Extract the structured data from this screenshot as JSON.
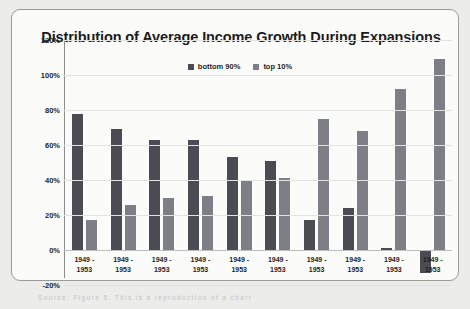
{
  "chart_data": {
    "type": "bar",
    "title": "Distribution of Average Income Growth During Expansions",
    "xlabel": "",
    "ylabel": "",
    "ylim": [
      -20,
      120
    ],
    "yticks": [
      120,
      100,
      80,
      60,
      40,
      20,
      0,
      -20
    ],
    "ytick_labels": [
      "120%",
      "100%",
      "80%",
      "60%",
      "40%",
      "20%",
      "0%",
      "-20%"
    ],
    "grid": true,
    "legend_position": "top-center",
    "categories": [
      "1949 -\n1953",
      "1949 -\n1953",
      "1949 -\n1953",
      "1949 -\n1953",
      "1949 -\n1953",
      "1949 -\n1953",
      "1949 -\n1953",
      "1949 -\n1953",
      "1949 -\n1953",
      "1949 -\n1953"
    ],
    "series": [
      {
        "name": "bottom 90%",
        "color": "#4b4b53",
        "values": [
          78,
          69,
          63,
          63,
          53,
          51,
          17,
          24,
          1,
          -13
        ]
      },
      {
        "name": "top 10%",
        "color": "#7e7e86",
        "values": [
          17,
          26,
          30,
          31,
          40,
          41,
          75,
          68,
          92,
          109
        ]
      }
    ]
  },
  "footer": {
    "source_note": "Source:  Figure 5. This is a reproduction of a chart"
  }
}
